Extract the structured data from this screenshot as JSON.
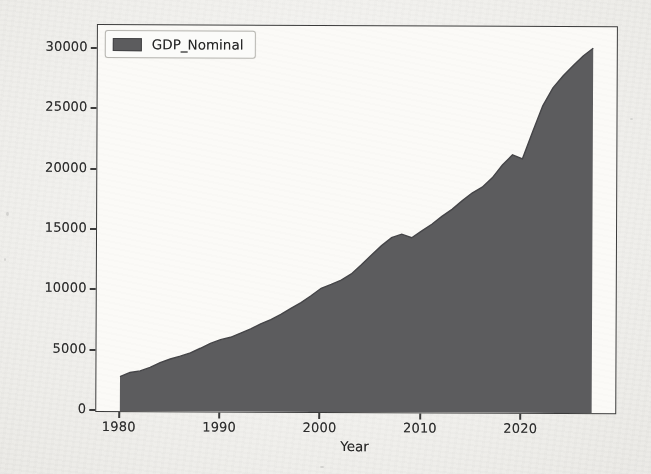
{
  "chart_data": {
    "type": "area",
    "title": "",
    "xlabel": "Year",
    "ylabel": "",
    "x": [
      1980,
      1981,
      1982,
      1983,
      1984,
      1985,
      1986,
      1987,
      1988,
      1989,
      1990,
      1991,
      1992,
      1993,
      1994,
      1995,
      1996,
      1997,
      1998,
      1999,
      2000,
      2001,
      2002,
      2003,
      2004,
      2005,
      2006,
      2007,
      2008,
      2009,
      2010,
      2011,
      2012,
      2013,
      2014,
      2015,
      2016,
      2017,
      2018,
      2019,
      2020,
      2021,
      2022,
      2023,
      2024,
      2025,
      2026,
      2027
    ],
    "series": [
      {
        "name": "GDP_Nominal",
        "values": [
          2857,
          3207,
          3344,
          3634,
          4038,
          4339,
          4580,
          4855,
          5236,
          5642,
          5963,
          6158,
          6520,
          6859,
          7287,
          7640,
          8073,
          8578,
          9063,
          9631,
          10251,
          10582,
          10936,
          11458,
          12214,
          13037,
          13815,
          14474,
          14770,
          14478,
          15049,
          15600,
          16254,
          16843,
          17551,
          18206,
          18695,
          19477,
          20533,
          21381,
          21060,
          23315,
          25463,
          26950,
          27950,
          28800,
          29600,
          30250
        ]
      }
    ],
    "xlim": [
      1977.65,
      2029.35
    ],
    "ylim": [
      0,
      32000
    ],
    "xticks": [
      1980,
      1990,
      2000,
      2010,
      2020
    ],
    "yticks": [
      0,
      5000,
      10000,
      15000,
      20000,
      25000,
      30000
    ],
    "grid": false,
    "legend": {
      "position": "upper left",
      "entries": [
        "GDP_Nominal"
      ]
    },
    "colors": {
      "area_fill": "#5c5c5e",
      "area_edge": "#454548",
      "spine": "#3b3b3b",
      "tick_text": "#2d2d2d",
      "axes_bg": "#fbfaf7",
      "paper_bg": "#f1f0ec"
    }
  }
}
